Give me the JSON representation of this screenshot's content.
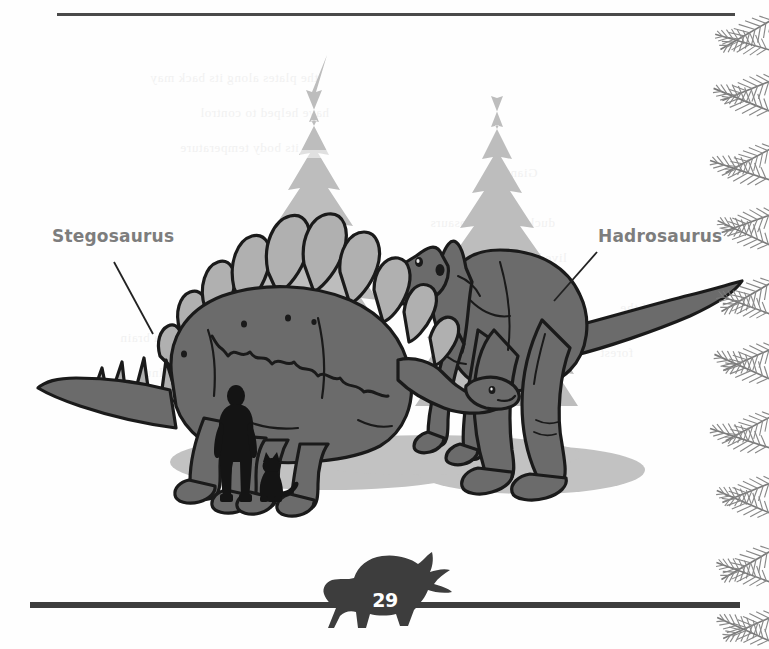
{
  "page": {
    "number": "29",
    "background_color": "#fefefe",
    "width": 769,
    "height": 649
  },
  "rules": {
    "top": {
      "color": "#4a4a4a"
    },
    "bottom": {
      "color": "#3d3d3d"
    }
  },
  "illustration": {
    "title": "Dinosaur size comparison illustration",
    "labels": [
      {
        "name": "stegosaurus",
        "text": "Stegosaurus",
        "color": "#7d7d7d",
        "leader_line": {
          "x1": 114,
          "y1": 262,
          "x2": 153,
          "y2": 334
        }
      },
      {
        "name": "hadrosaurus",
        "text": "Hadrosaurus",
        "color": "#7d7d7d",
        "leader_line": {
          "x1": 597,
          "y1": 252,
          "x2": 555,
          "y2": 300
        }
      }
    ],
    "colors": {
      "dino_body": "#6b6b6b",
      "dino_plates": "#b0b0b0",
      "outline": "#1a1a1a",
      "ground_shadow": "#c2c2c2",
      "tree_foliage": "#bdbdbd",
      "tree_trunk": "#9a9a9a",
      "silhouette": "#141414",
      "fern_border": "#8c8c8c"
    },
    "scene_elements": [
      "conifer-tree-left",
      "conifer-tree-right",
      "stegosaurus",
      "hadrosaurus",
      "human-scale-silhouette",
      "cat-scale-silhouette",
      "ground-shadow",
      "fern-border-strip",
      "triceratops-page-marker"
    ]
  },
  "bleed_text": [
    {
      "text": "the plates along its back may",
      "x": 150,
      "y": 70
    },
    {
      "text": "have helped to control",
      "x": 200,
      "y": 105
    },
    {
      "text": "its body temperature",
      "x": 180,
      "y": 140
    },
    {
      "text": "Stegosaurus had a brain",
      "x": 120,
      "y": 330
    },
    {
      "text": "no bigger than a walnut",
      "x": 140,
      "y": 365
    },
    {
      "text": "duck-billed dinosaurs",
      "x": 430,
      "y": 215
    },
    {
      "text": "lived in large herds",
      "x": 455,
      "y": 250
    },
    {
      "text": "Giants",
      "x": 500,
      "y": 165
    },
    {
      "text": "of the",
      "x": 620,
      "y": 300
    },
    {
      "text": "forest",
      "x": 600,
      "y": 345
    }
  ]
}
